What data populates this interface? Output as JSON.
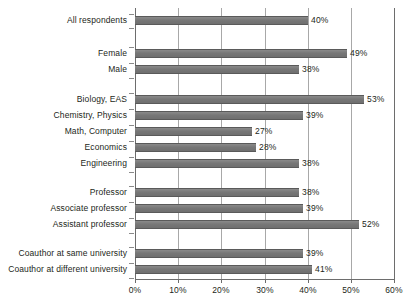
{
  "chart_data": {
    "type": "bar",
    "orientation": "horizontal",
    "title": "",
    "subtitle": "",
    "xlabel": "",
    "ylabel": "",
    "xlim": [
      0,
      60
    ],
    "xticks": [
      0,
      10,
      20,
      30,
      40,
      50,
      60
    ],
    "xticklabels": [
      "0%",
      "10%",
      "20%",
      "30%",
      "40%",
      "50%",
      "60%"
    ],
    "grid": "vertical",
    "legend": "none",
    "value_suffix": "%",
    "bar_color": "#7c7c7c",
    "bar_edge_color": "#5a5a5a",
    "gridline_color": "#a8a8a8",
    "axis_color": "#6d6d6d",
    "text_color": "#231f20",
    "categories": [
      "All respondents",
      "Female",
      "Male",
      "Biology, EAS",
      "Chemistry, Physics",
      "Math, Computer",
      "Economics",
      "Engineering",
      "Professor",
      "Associate professor",
      "Assistant professor",
      "Coauthor at same university",
      "Coauthor at different university"
    ],
    "values": [
      40,
      49,
      38,
      53,
      39,
      27,
      28,
      38,
      38,
      39,
      52,
      39,
      41
    ],
    "value_labels": [
      "40%",
      "49%",
      "38%",
      "53%",
      "39%",
      "27%",
      "28%",
      "38%",
      "38%",
      "39%",
      "52%",
      "39%",
      "41%"
    ],
    "groups": [
      {
        "name": "overall",
        "categories": [
          "All respondents"
        ]
      },
      {
        "name": "gender",
        "categories": [
          "Female",
          "Male"
        ]
      },
      {
        "name": "field",
        "categories": [
          "Biology, EAS",
          "Chemistry, Physics",
          "Math, Computer",
          "Economics",
          "Engineering"
        ]
      },
      {
        "name": "rank",
        "categories": [
          "Professor",
          "Associate professor",
          "Assistant professor"
        ]
      },
      {
        "name": "coauthor-location",
        "categories": [
          "Coauthor at same university",
          "Coauthor at different university"
        ]
      }
    ]
  }
}
